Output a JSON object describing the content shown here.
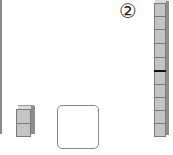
{
  "problem": {
    "number_label": "②",
    "ten_rod": {
      "units": 10,
      "highlight_after_unit": 5
    },
    "unit_cubes": {
      "count": 2
    },
    "answer_box": {
      "value": ""
    }
  },
  "colors": {
    "block_fill": "#c4c4c4",
    "block_edge": "#7a7a7a",
    "block_side": "#8e8e8e",
    "divider_dark": "#111111"
  }
}
